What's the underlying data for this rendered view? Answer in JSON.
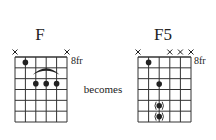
{
  "caption": "becomes",
  "colors": {
    "ink": "#222222",
    "grid": "#333333",
    "background": "#ffffff"
  },
  "diagrams": [
    {
      "name": "F",
      "fret_label": "8fr",
      "strings": 6,
      "frets": 6,
      "muted_strings": [
        1,
        6
      ],
      "dots": [
        {
          "string": 2,
          "fret": 1,
          "optional": false
        },
        {
          "string": 3,
          "fret": 3,
          "optional": false
        },
        {
          "string": 4,
          "fret": 3,
          "optional": false
        },
        {
          "string": 5,
          "fret": 3,
          "optional": false
        }
      ],
      "barre_arc": {
        "from_string": 3,
        "to_string": 5,
        "fret": 3
      }
    },
    {
      "name": "F5",
      "fret_label": "8fr",
      "strings": 6,
      "frets": 6,
      "muted_strings": [
        1,
        4,
        5,
        6
      ],
      "dots": [
        {
          "string": 2,
          "fret": 1,
          "optional": false
        },
        {
          "string": 3,
          "fret": 3,
          "optional": false
        },
        {
          "string": 3,
          "fret": 5,
          "optional": true
        },
        {
          "string": 3,
          "fret": 6,
          "optional": true
        }
      ],
      "barre_arc": null
    }
  ]
}
